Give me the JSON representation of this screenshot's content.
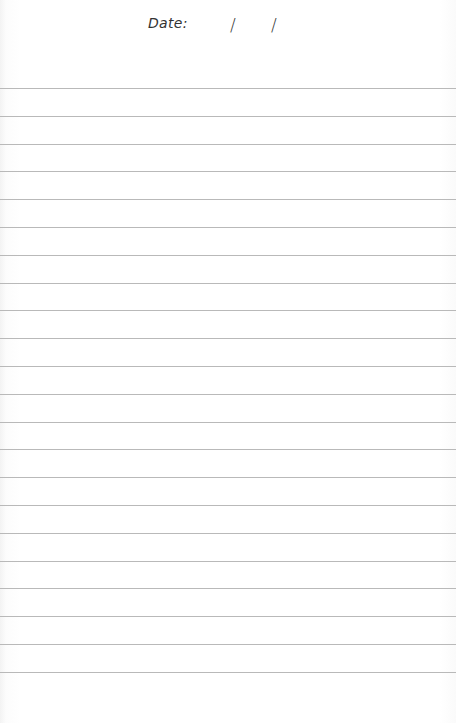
{
  "page": {
    "type": "lined-notebook-page",
    "background_color": "#ffffff",
    "line_color": "#b9b9b9"
  },
  "header": {
    "date_label": "Date:",
    "date_separator_1": "/",
    "date_separator_2": "/",
    "date_value": ""
  },
  "ruled_lines": {
    "count": 22,
    "first_y": 88,
    "spacing": 27.8
  }
}
